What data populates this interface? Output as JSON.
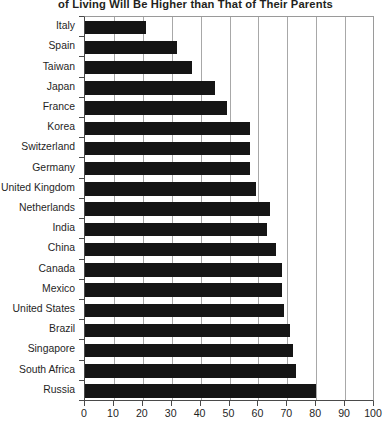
{
  "chart_data": {
    "type": "bar",
    "orientation": "horizontal",
    "title": "of Living Will Be Higher than That of Their Parents",
    "xlabel": "",
    "ylabel": "",
    "xlim": [
      0,
      100
    ],
    "xticks": [
      0,
      10,
      20,
      30,
      40,
      50,
      60,
      70,
      80,
      90,
      100
    ],
    "xtick_labels": [
      "0",
      "10",
      "20",
      "30",
      "40",
      "50",
      "60",
      "70",
      "80",
      "90",
      "100"
    ],
    "grid": true,
    "grid_axis": "x",
    "legend": false,
    "bar_color": "#151515",
    "categories": [
      "Italy",
      "Spain",
      "Taiwan",
      "Japan",
      "France",
      "Korea",
      "Switzerland",
      "Germany",
      "United Kingdom",
      "Netherlands",
      "India",
      "China",
      "Canada",
      "Mexico",
      "United States",
      "Brazil",
      "Singapore",
      "South Africa",
      "Russia"
    ],
    "values": [
      21,
      32,
      37,
      45,
      49,
      57,
      57,
      57,
      59,
      64,
      63,
      66,
      68,
      68,
      69,
      71,
      72,
      73,
      80
    ]
  }
}
